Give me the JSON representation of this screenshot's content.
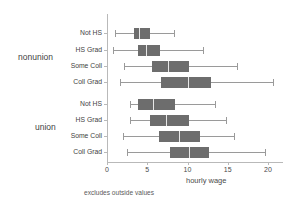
{
  "chart_data": {
    "type": "box",
    "title": "",
    "xlabel": "hourly wage",
    "ylabel": "",
    "footnote": "excludes outside values",
    "xlim": [
      0,
      21.5
    ],
    "xticks": [
      0,
      5,
      10,
      15,
      20
    ],
    "xticklabels": [
      "0",
      "5",
      "10",
      "15",
      "20"
    ],
    "grid": false,
    "legend": "none",
    "orientation": "horizontal",
    "groups": [
      {
        "name": "nonunion",
        "categories": [
          {
            "label": "Not HS",
            "whisker_low": 1.0,
            "q1": 3.3,
            "median": 4.0,
            "q3": 5.4,
            "whisker_high": 8.3
          },
          {
            "label": "HS Grad",
            "whisker_low": 0.7,
            "q1": 3.8,
            "median": 4.8,
            "q3": 6.6,
            "whisker_high": 11.9
          },
          {
            "label": "Some Coll",
            "whisker_low": 2.1,
            "q1": 5.6,
            "median": 7.6,
            "q3": 10.2,
            "whisker_high": 16.1
          },
          {
            "label": "Coll Grad",
            "whisker_low": 1.6,
            "q1": 6.7,
            "median": 10.0,
            "q3": 12.9,
            "whisker_high": 20.6
          }
        ]
      },
      {
        "name": "union",
        "categories": [
          {
            "label": "Not HS",
            "whisker_low": 2.9,
            "q1": 3.8,
            "median": 5.7,
            "q3": 8.5,
            "whisker_high": 13.4
          },
          {
            "label": "HS Grad",
            "whisker_low": 2.8,
            "q1": 5.3,
            "median": 7.3,
            "q3": 10.2,
            "whisker_high": 14.8
          },
          {
            "label": "Some Coll",
            "whisker_low": 2.0,
            "q1": 6.5,
            "median": 9.0,
            "q3": 11.5,
            "whisker_high": 15.8
          },
          {
            "label": "Coll Grad",
            "whisker_low": 2.5,
            "q1": 7.8,
            "median": 10.2,
            "q3": 12.7,
            "whisker_high": 19.6
          }
        ]
      }
    ],
    "colors": {
      "box_fill": "#6d6d6d",
      "median_line": "#e8e8e8",
      "whisker": "#9a9a9a",
      "axis": "#b9b9b9",
      "text": "#4a4a4a",
      "background": "#ffffff"
    }
  }
}
